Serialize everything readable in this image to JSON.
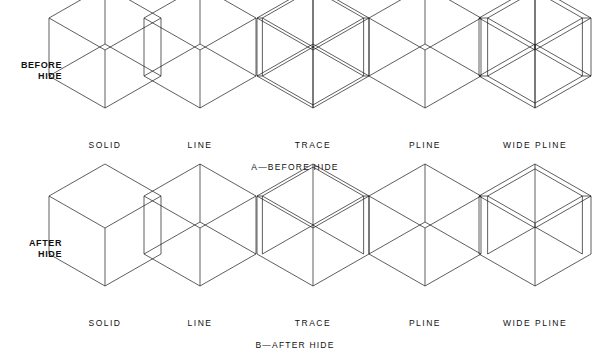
{
  "figure": {
    "line_color": "#1a1a1a",
    "background": "#ffffff",
    "stroke_width": 0.7
  },
  "rows": [
    {
      "id": "before-hide",
      "label": "BEFORE\nHIDE",
      "caption": "A—BEFORE HIDE",
      "caption_x": 295,
      "label_x": 34,
      "label_y": 72,
      "top": 14,
      "hidden_lines_shown": true
    },
    {
      "id": "after-hide",
      "label": "AFTER\nHIDE",
      "caption": "B—AFTER HIDE",
      "caption_x": 295,
      "label_x": 34,
      "label_y": 250,
      "top": 192,
      "hidden_lines_shown": false
    }
  ],
  "columns": [
    {
      "id": "solid",
      "label": "SOLID",
      "center_x": 105,
      "entity": "solid",
      "wall": 0
    },
    {
      "id": "line",
      "label": "LINE",
      "center_x": 200,
      "entity": "line",
      "wall": 0
    },
    {
      "id": "trace",
      "label": "TRACE",
      "center_x": 313,
      "entity": "trace",
      "wall": 5
    },
    {
      "id": "pline",
      "label": "PLINE",
      "center_x": 425,
      "entity": "pline",
      "wall": 0
    },
    {
      "id": "wide-pline",
      "label": "WIDE  PLINE",
      "center_x": 535,
      "entity": "wide-pline",
      "wall": 8
    }
  ],
  "label_rows": [
    {
      "id": "labels-top",
      "y": 140
    },
    {
      "id": "labels-bottom",
      "y": 318
    }
  ],
  "chart_data": {
    "type": "diagram",
    "subfigures": [
      "A—BEFORE HIDE",
      "B—AFTER HIDE"
    ],
    "categories": [
      "SOLID",
      "LINE",
      "TRACE",
      "PLINE",
      "WIDE PLINE"
    ],
    "row_labels": [
      "BEFORE HIDE",
      "AFTER HIDE"
    ]
  }
}
